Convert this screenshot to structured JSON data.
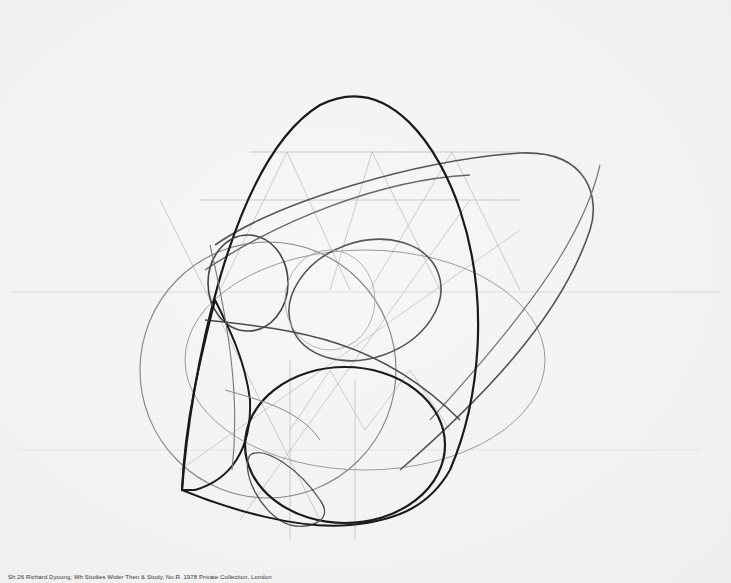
{
  "artwork": {
    "subject": "Geometric pencil construction drawing of nested curves, circles and ovals",
    "medium_appearance": "graphite on paper",
    "colors": {
      "paper": "#f4f4f3",
      "heavy_line": "#1a1a1a",
      "medium_line": "#555555",
      "construction_line": "#b0b0b0"
    }
  },
  "caption": {
    "text": "Sh.26 Richard Dyoung, Wh Studies Wider Then & Study, No.R. 1978 Private Collection, London"
  }
}
